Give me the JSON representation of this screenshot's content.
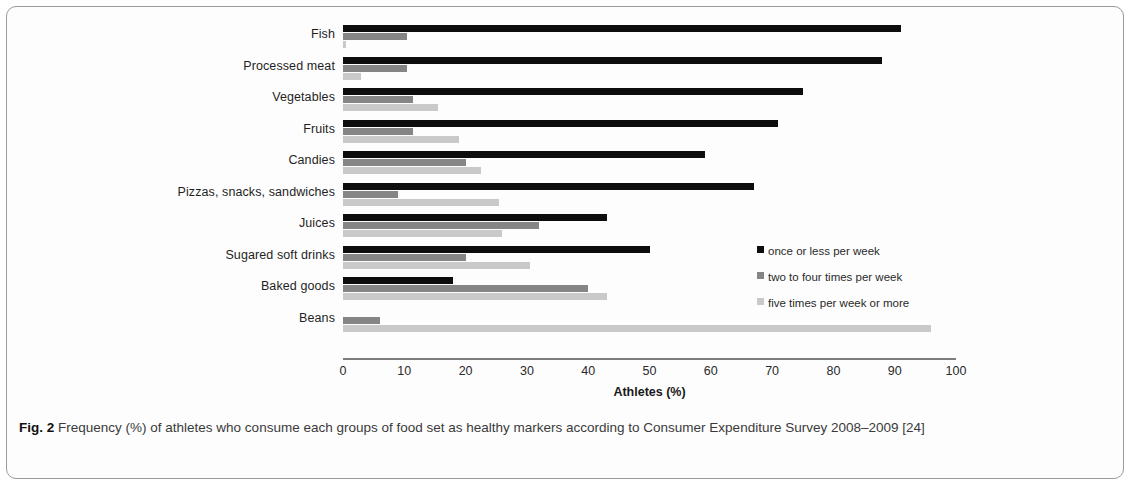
{
  "figure": {
    "caption_label": "Fig. 2",
    "caption_text": "Frequency (%) of athletes who consume each groups of food set as healthy markers according to Consumer Expenditure Survey 2008–2009 [24]"
  },
  "legend": {
    "position": "inside-right",
    "entries": [
      {
        "label": "once or less per week",
        "color": "#0d0d0d",
        "icon": "square-swatch-icon"
      },
      {
        "label": "two to four times per week",
        "color": "#858585",
        "icon": "square-swatch-icon"
      },
      {
        "label": "five times per week or more",
        "color": "#c9c9c9",
        "icon": "square-swatch-icon"
      }
    ]
  },
  "chart_data": {
    "type": "bar",
    "orientation": "horizontal",
    "title": "",
    "xlabel": "Athletes (%)",
    "ylabel": "",
    "xlim": [
      0,
      100
    ],
    "xticks": [
      0,
      10,
      20,
      30,
      40,
      50,
      60,
      70,
      80,
      90,
      100
    ],
    "grid": false,
    "categories": [
      "Fish",
      "Processed meat",
      "Vegetables",
      "Fruits",
      "Candies",
      "Pizzas, snacks, sandwiches",
      "Juices",
      "Sugared soft drinks",
      "Baked goods",
      "Beans"
    ],
    "series": [
      {
        "name": "once or less per week",
        "color": "#0d0d0d",
        "values": [
          91,
          88,
          75,
          71,
          59,
          67,
          43,
          50,
          18,
          0
        ]
      },
      {
        "name": "two to four times per week",
        "color": "#858585",
        "values": [
          10.5,
          10.5,
          11.5,
          11.5,
          20,
          9,
          32,
          20,
          40,
          6
        ]
      },
      {
        "name": "five times per week or more",
        "color": "#c9c9c9",
        "values": [
          0.5,
          3,
          15.5,
          19,
          22.5,
          25.5,
          26,
          30.5,
          43,
          96
        ]
      }
    ]
  }
}
